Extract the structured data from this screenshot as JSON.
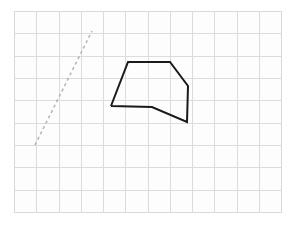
{
  "figure": {
    "title": "",
    "background_color": "#ffffff",
    "canvas": {
      "x": 14,
      "y": 11,
      "width": 267,
      "height": 201,
      "fill": "#fdfdfd",
      "border_color": "#d8d8d8",
      "border_width": 1
    },
    "grid": {
      "enabled": true,
      "cell_width": 22.25,
      "cell_height": 22.33,
      "columns": 12,
      "rows": 9,
      "line_color": "#dcdcdc",
      "line_width": 1
    },
    "shapes": [
      {
        "name": "polygon-outline",
        "type": "polyline",
        "closed": false,
        "stroke_color": "#1a1a1a",
        "stroke_width": 2,
        "fill": "none",
        "dash": "none",
        "points": [
          [
            111,
            106
          ],
          [
            128,
            62
          ],
          [
            170,
            62
          ],
          [
            188,
            86
          ],
          [
            187,
            122
          ],
          [
            152,
            107
          ],
          [
            111,
            106
          ]
        ]
      },
      {
        "name": "dashed-line-segment",
        "type": "line",
        "closed": false,
        "stroke_color": "#b4b4b4",
        "stroke_width": 1.5,
        "fill": "none",
        "dash": "3 3",
        "points": [
          [
            35,
            145
          ],
          [
            92,
            31
          ]
        ]
      }
    ]
  },
  "chart_data": {
    "type": "scatter",
    "title": "",
    "xlabel": "",
    "ylabel": "",
    "grid": true,
    "legend": "none",
    "xlim": [
      0,
      12
    ],
    "ylim": [
      0,
      9
    ],
    "series": [
      {
        "name": "polygon-outline",
        "style": "solid",
        "color": "#1a1a1a",
        "x": [
          4.36,
          5.12,
          7.01,
          7.82,
          7.77,
          6.2,
          4.36
        ],
        "y": [
          4.74,
          6.71,
          6.71,
          5.64,
          4.03,
          4.7,
          4.74
        ]
      },
      {
        "name": "dashed-line-segment",
        "style": "dashed",
        "color": "#b4b4b4",
        "x": [
          0.94,
          3.51
        ],
        "y": [
          3.0,
          8.11
        ]
      }
    ]
  }
}
